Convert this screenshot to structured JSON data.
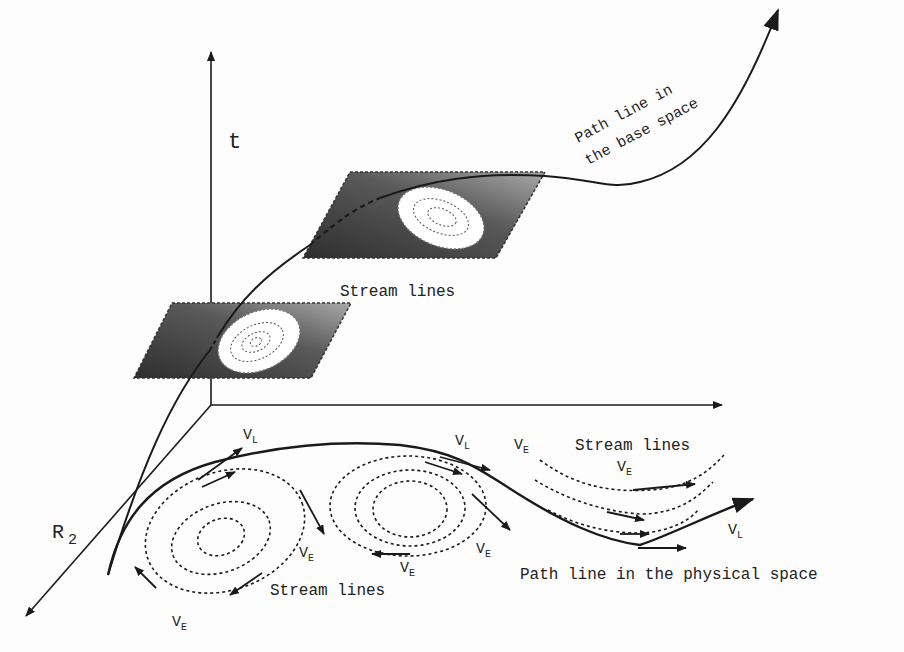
{
  "diagram": {
    "axes": {
      "t_label": "t",
      "r2_label": "R",
      "r2_sub": "2"
    },
    "base_space": {
      "path_label_line1": "Path line in",
      "path_label_line2": "the base space",
      "stream_lines_label": "Stream lines"
    },
    "physical_space": {
      "path_label": "Path line in the physical space",
      "stream_lines_left": "Stream lines",
      "stream_lines_right": "Stream lines",
      "vectors": [
        {
          "name": "V",
          "sub": "L"
        },
        {
          "name": "V",
          "sub": "L"
        },
        {
          "name": "V",
          "sub": "L"
        },
        {
          "name": "V",
          "sub": "E"
        },
        {
          "name": "V",
          "sub": "E"
        },
        {
          "name": "V",
          "sub": "E"
        },
        {
          "name": "V",
          "sub": "E"
        },
        {
          "name": "V",
          "sub": "E"
        },
        {
          "name": "V",
          "sub": "E"
        }
      ]
    },
    "colors": {
      "ink": "#1a1a1a",
      "plane_dark": "#3a3a3a",
      "plane_light": "#9a9a9a",
      "vortex_fill": "#ffffff"
    }
  }
}
